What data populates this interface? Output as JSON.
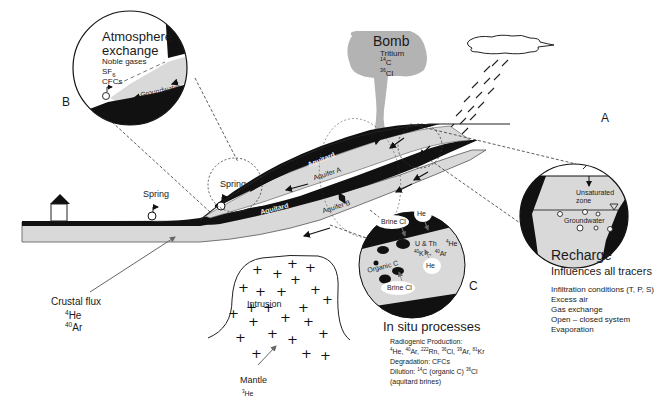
{
  "diagram": {
    "colors": {
      "aquitard": "#111111",
      "aquifer": "#d9d9d9",
      "bomb_cloud": "#b3b3b3",
      "line": "#222222"
    },
    "panel_a": {
      "letter": "A",
      "unsaturated_zone_label": "Unsaturated zone",
      "unsaturated_line1": "Unsaturated",
      "unsaturated_line2": "zone",
      "groundwater_label": "Groundwater"
    },
    "panel_b": {
      "letter": "B",
      "title_line1": "Atmosphere",
      "title_line2": "exchange",
      "items": [
        "Noble gases",
        "SF6",
        "CFCs"
      ],
      "sf6_base": "SF",
      "sf6_sub": "6",
      "groundwater_label": "Groundwater"
    },
    "panel_c": {
      "letter": "C",
      "brine_top": "Brine Cl",
      "brine_bottom": "Brine Cl",
      "he_top": "He",
      "he_bottom": "He",
      "u_th": "U & Th",
      "k_ar_sup1": "40",
      "k_ar_base1": "K → ",
      "k_ar_sup2": "40",
      "k_ar_base2": "Ar",
      "he4_sup": "4",
      "he4_base": "He",
      "organic_c": "Organic C"
    },
    "bomb": {
      "title": "Bomb",
      "tritium": "Tritium",
      "c14_sup": "14",
      "c14_base": "C",
      "cl36_sup": "36",
      "cl36_base": "Cl"
    },
    "layers": {
      "aquitard_upper": "Aquitard",
      "aquitard_lower": "Aquitard",
      "aquifer_a": "Aquifer A",
      "aquifer_b": "Aquifer B"
    },
    "springs": [
      "Spring",
      "Spring"
    ],
    "crustal_flux": {
      "label": "Crustal flux",
      "he4_sup": "4",
      "he4_base": "He",
      "ar40_sup": "40",
      "ar40_base": "Ar"
    },
    "intrusion": {
      "label": "Intrusion"
    },
    "mantle": {
      "label": "Mantle",
      "he3_sup": "3",
      "he3_base": "He"
    },
    "recharge": {
      "title": "Recharge",
      "subtitle": "Influences all tracers",
      "items": [
        "Infiltration conditions (T, P, S)",
        "Excess air",
        "Gas exchange",
        "Open – closed system",
        "Evaporation"
      ]
    },
    "in_situ": {
      "title": "In situ processes",
      "radiogenic_label": "Radiogenic Production:",
      "radiogenic_list": {
        "he4": {
          "sup": "4",
          "base": "He, "
        },
        "ar40": {
          "sup": "40",
          "base": "Ar, "
        },
        "rn222": {
          "sup": "222",
          "base": "Rn, "
        },
        "cl36": {
          "sup": "36",
          "base": "Cl, "
        },
        "ar39": {
          "sup": "39",
          "base": "Ar, "
        },
        "kr81": {
          "sup": "81",
          "base": "Kr"
        }
      },
      "degradation": "Degradation: CFCs",
      "dilution_prefix": "Dilution: ",
      "dilution_c14_sup": "14",
      "dilution_c14_base": "C (organic C) ",
      "dilution_cl36_sup": "36",
      "dilution_cl36_base": "Cl",
      "dilution_line2": "(aquitard brines)"
    }
  }
}
